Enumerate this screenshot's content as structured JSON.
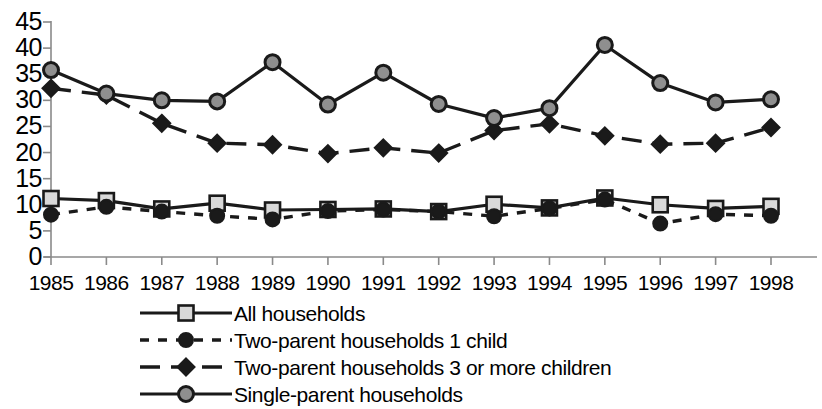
{
  "chart_data": {
    "type": "line",
    "title": "",
    "xlabel": "",
    "ylabel": "",
    "categories": [
      "1985",
      "1986",
      "1987",
      "1988",
      "1989",
      "1990",
      "1991",
      "1992",
      "1993",
      "1994",
      "1995",
      "1996",
      "1997",
      "1998"
    ],
    "ylim": [
      0,
      45
    ],
    "yticks": [
      0,
      5,
      10,
      15,
      20,
      25,
      30,
      35,
      40,
      45
    ],
    "grid": false,
    "legend_position": "bottom",
    "series": [
      {
        "name": "All households",
        "marker": "open-square",
        "line": "solid",
        "color": "#1a1a1a",
        "values": [
          11.2,
          10.8,
          9.2,
          10.3,
          9.0,
          9.1,
          9.2,
          8.7,
          10.1,
          9.4,
          11.3,
          10.0,
          9.3,
          9.7
        ]
      },
      {
        "name": "Two-parent households 1 child",
        "marker": "filled-circle",
        "line": "dotted",
        "color": "#1a1a1a",
        "values": [
          8.1,
          9.6,
          8.7,
          7.9,
          7.2,
          8.8,
          9.1,
          8.7,
          7.8,
          9.3,
          11.0,
          6.4,
          8.2,
          7.9
        ]
      },
      {
        "name": "Two-parent households 3 or more children",
        "marker": "filled-diamond",
        "line": "dashed",
        "color": "#1a1a1a",
        "values": [
          32.3,
          31.0,
          25.6,
          21.8,
          21.5,
          19.8,
          20.9,
          19.9,
          24.2,
          25.5,
          23.2,
          21.6,
          21.8,
          24.8
        ]
      },
      {
        "name": "Single-parent households",
        "marker": "shaded-circle",
        "line": "solid",
        "color": "#1a1a1a",
        "values": [
          35.8,
          31.3,
          30.0,
          29.8,
          37.3,
          29.2,
          35.3,
          29.3,
          26.6,
          28.5,
          40.6,
          33.3,
          29.6,
          30.2
        ]
      }
    ]
  },
  "axis": {
    "y_tick_labels": [
      "45",
      "40",
      "35",
      "30",
      "25",
      "20",
      "15",
      "10",
      "5",
      "0"
    ],
    "x_tick_labels": [
      "1985",
      "1986",
      "1987",
      "1988",
      "1989",
      "1990",
      "1991",
      "1992",
      "1993",
      "1994",
      "1995",
      "1996",
      "1997",
      "1998"
    ]
  },
  "legend": {
    "items": [
      {
        "label": "All households",
        "marker": "open-square",
        "line": "solid"
      },
      {
        "label": "Two-parent households 1 child",
        "marker": "filled-circle",
        "line": "dotted"
      },
      {
        "label": "Two-parent households 3 or more children",
        "marker": "filled-diamond",
        "line": "dashed"
      },
      {
        "label": "Single-parent households",
        "marker": "shaded-circle",
        "line": "solid"
      }
    ]
  },
  "colors": {
    "ink": "#1a1a1a",
    "axis": "#8a8a8a",
    "marker_fill_light": "#d9d9d9",
    "marker_fill_mid": "#8f8f8f",
    "background": "#ffffff"
  }
}
